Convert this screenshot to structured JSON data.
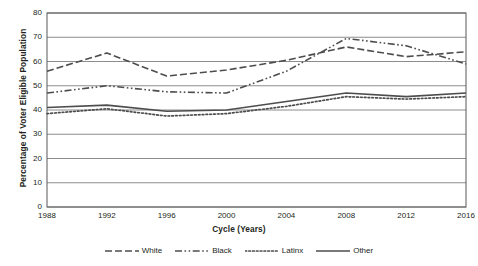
{
  "chart_data": {
    "type": "line",
    "title": "",
    "xlabel": "Cycle (Years)",
    "ylabel": "Percentage of Voter Eligible Population",
    "x": [
      1988,
      1992,
      1996,
      2000,
      2004,
      2008,
      2012,
      2016
    ],
    "categories": [
      "1988",
      "1992",
      "1996",
      "2000",
      "2004",
      "2008",
      "2012",
      "2016"
    ],
    "xlim": [
      1988,
      2016
    ],
    "ylim": [
      0,
      80
    ],
    "ytick_labels": [
      "0",
      "10",
      "20",
      "30",
      "40",
      "50",
      "60",
      "70",
      "80"
    ],
    "ytick_values": [
      0,
      10,
      20,
      30,
      40,
      50,
      60,
      70,
      80
    ],
    "grid": "horizontal",
    "legend_position": "bottom",
    "series": [
      {
        "name": "White",
        "style": "dashed",
        "color": "#4d4d4d",
        "values": [
          56.0,
          63.5,
          54.0,
          56.5,
          60.5,
          66.0,
          62.0,
          64.0
        ]
      },
      {
        "name": "Black",
        "style": "dash-dot",
        "color": "#4d4d4d",
        "values": [
          47.0,
          50.0,
          47.5,
          47.0,
          56.0,
          69.5,
          66.5,
          59.0
        ]
      },
      {
        "name": "Latinx",
        "style": "dotted",
        "color": "#4d4d4d",
        "values": [
          38.5,
          40.5,
          37.5,
          38.5,
          41.5,
          45.5,
          44.5,
          45.5
        ]
      },
      {
        "name": "Other",
        "style": "solid",
        "color": "#4d4d4d",
        "values": [
          41.0,
          42.0,
          39.5,
          40.0,
          43.5,
          47.0,
          45.5,
          47.0
        ]
      }
    ]
  },
  "axes": {
    "y_title": "Percentage of Voter Eligible Population",
    "x_title": "Cycle (Years)"
  },
  "legend": {
    "items": [
      {
        "label": "White"
      },
      {
        "label": "Black"
      },
      {
        "label": "Latinx"
      },
      {
        "label": "Other"
      }
    ]
  }
}
